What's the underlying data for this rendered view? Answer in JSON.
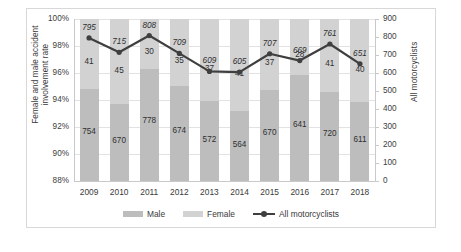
{
  "chart_data": {
    "type": "bar",
    "title": "",
    "subtitle": "",
    "xlabel": "",
    "ylabel": "Female and male accident involvement rate",
    "y2label": "All motorcyclists",
    "categories": [
      "2009",
      "2010",
      "2011",
      "2012",
      "2013",
      "2014",
      "2015",
      "2016",
      "2017",
      "2018"
    ],
    "ylim": [
      88,
      100
    ],
    "y2lim": [
      0,
      900
    ],
    "y_ticks": [
      "88%",
      "90%",
      "92%",
      "94%",
      "96%",
      "98%",
      "100%"
    ],
    "y_tick_values": [
      88,
      90,
      92,
      94,
      96,
      98,
      100
    ],
    "y2_ticks": [
      "0",
      "100",
      "200",
      "300",
      "400",
      "500",
      "600",
      "700",
      "800",
      "900"
    ],
    "y2_tick_values": [
      0,
      100,
      200,
      300,
      400,
      500,
      600,
      700,
      800,
      900
    ],
    "grid": true,
    "legend_position": "bottom",
    "series": [
      {
        "name": "Male",
        "kind": "bar-stacked",
        "axis": "left",
        "color": "#bdbdbd",
        "values": [
          754,
          670,
          778,
          674,
          572,
          564,
          670,
          641,
          720,
          611
        ],
        "share_pct": [
          94.84,
          93.71,
          96.29,
          95.06,
          93.92,
          93.22,
          94.77,
          95.82,
          94.61,
          93.85
        ]
      },
      {
        "name": "Female",
        "kind": "bar-stacked",
        "axis": "left",
        "color": "#d2d2d2",
        "values": [
          41,
          45,
          30,
          35,
          37,
          41,
          37,
          28,
          41,
          40
        ],
        "share_pct": [
          5.16,
          6.29,
          3.71,
          4.94,
          6.08,
          6.78,
          5.23,
          4.18,
          5.39,
          6.15
        ]
      },
      {
        "name": "All motorcyclists",
        "kind": "line",
        "axis": "right",
        "color": "#3f3f3f",
        "values": [
          795,
          715,
          808,
          709,
          609,
          605,
          707,
          669,
          761,
          651
        ]
      }
    ]
  },
  "legend": {
    "items": [
      {
        "label": "Male",
        "icon": "square-swatch-icon"
      },
      {
        "label": "Female",
        "icon": "square-swatch-icon"
      },
      {
        "label": "All motorcyclists",
        "icon": "line-marker-icon"
      }
    ]
  }
}
